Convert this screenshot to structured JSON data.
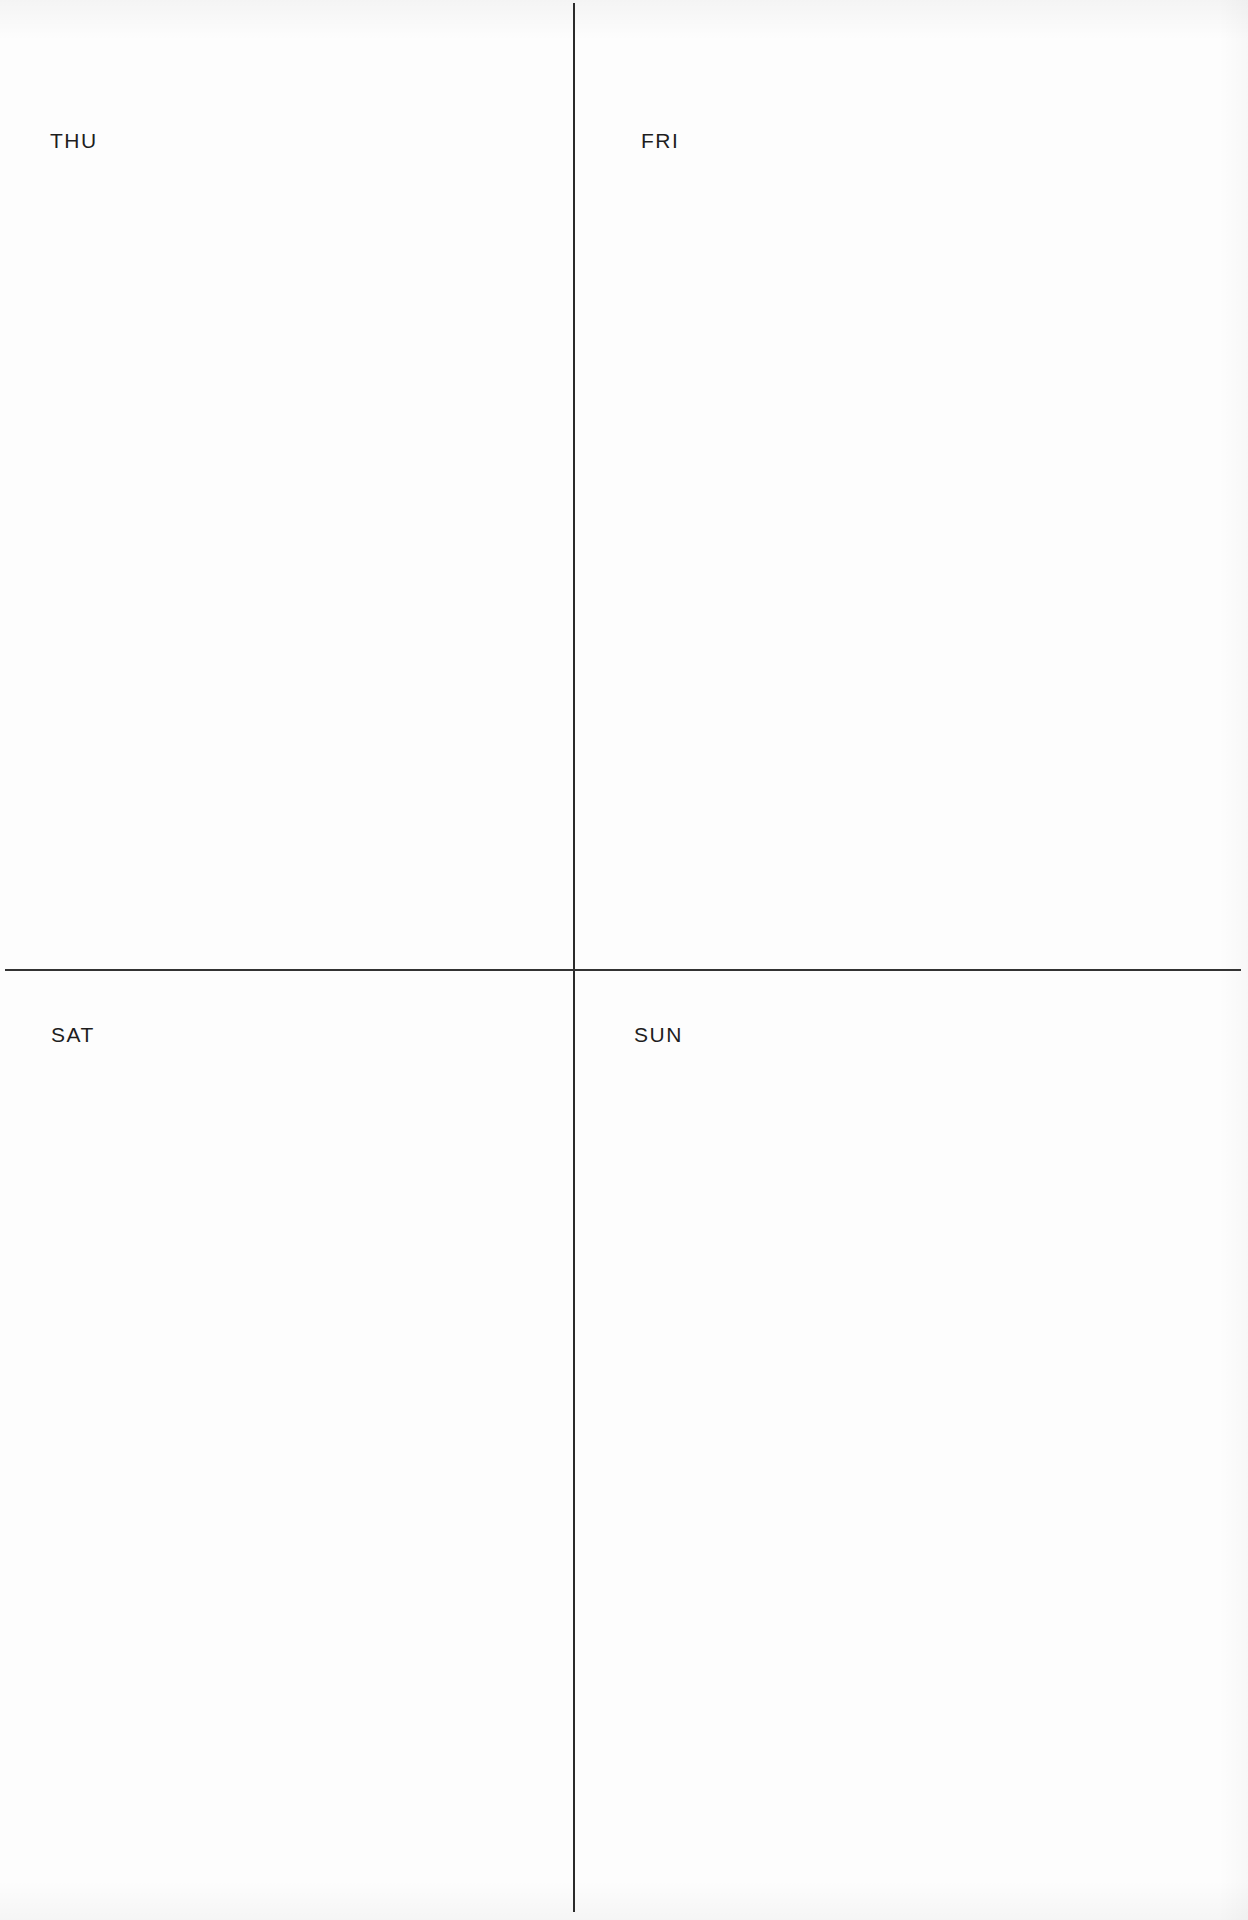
{
  "document": {
    "type": "weekly-planner-page",
    "background_color": "#fdfdfd",
    "line_color": "#2b2b2b"
  },
  "quadrants": [
    {
      "position": "top-left",
      "day_label": "THU"
    },
    {
      "position": "top-right",
      "day_label": "FRI"
    },
    {
      "position": "bottom-left",
      "day_label": "SAT"
    },
    {
      "position": "bottom-right",
      "day_label": "SUN"
    }
  ]
}
